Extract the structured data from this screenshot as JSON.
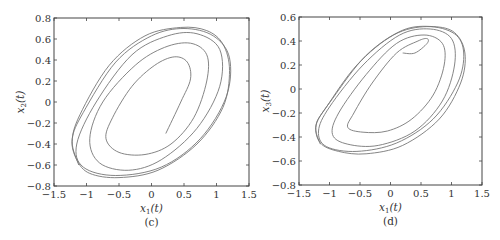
{
  "chart_data": [
    {
      "type": "line",
      "panel": "(c)",
      "title": "",
      "xlabel": "x1(t)",
      "ylabel": "x2(t)",
      "xlim": [
        -1.5,
        1.5
      ],
      "ylim": [
        -0.8,
        0.8
      ],
      "xticks": [
        "-1.5",
        "-1",
        "-0.5",
        "0",
        "0.5",
        "1",
        "1.5"
      ],
      "yticks": [
        "-0.8",
        "-0.6",
        "-0.4",
        "-0.2",
        "0",
        "0.2",
        "0.4",
        "0.6",
        "0.8"
      ],
      "grid": false,
      "legend": null,
      "description": "Phase-plane trajectory spiraling outward from about (0.2, -0.3) toward a tilted elliptical limit cycle",
      "series": [
        {
          "name": "trajectory",
          "points": [
            [
              0.22,
              -0.3
            ],
            [
              0.45,
              0.0
            ],
            [
              0.6,
              0.22
            ],
            [
              0.55,
              0.38
            ],
            [
              0.35,
              0.43
            ],
            [
              0.05,
              0.35
            ],
            [
              -0.3,
              0.15
            ],
            [
              -0.6,
              -0.15
            ],
            [
              -0.7,
              -0.35
            ],
            [
              -0.5,
              -0.48
            ],
            [
              -0.1,
              -0.5
            ],
            [
              0.3,
              -0.4
            ],
            [
              0.65,
              -0.15
            ],
            [
              0.85,
              0.2
            ],
            [
              0.85,
              0.45
            ],
            [
              0.6,
              0.56
            ],
            [
              0.2,
              0.52
            ],
            [
              -0.25,
              0.35
            ],
            [
              -0.75,
              0.0
            ],
            [
              -0.95,
              -0.35
            ],
            [
              -0.8,
              -0.58
            ],
            [
              -0.35,
              -0.65
            ],
            [
              0.15,
              -0.55
            ],
            [
              0.7,
              -0.25
            ],
            [
              1.05,
              0.15
            ],
            [
              1.05,
              0.5
            ],
            [
              0.7,
              0.65
            ],
            [
              0.25,
              0.63
            ],
            [
              -0.3,
              0.45
            ],
            [
              -0.85,
              0.0
            ],
            [
              -1.15,
              -0.4
            ],
            [
              -1.05,
              -0.62
            ],
            [
              -0.55,
              -0.7
            ],
            [
              0.15,
              -0.62
            ],
            [
              0.75,
              -0.35
            ],
            [
              1.15,
              0.05
            ],
            [
              1.2,
              0.42
            ],
            [
              0.95,
              0.63
            ],
            [
              0.5,
              0.7
            ],
            [
              0.0,
              0.63
            ],
            [
              -0.55,
              0.38
            ],
            [
              -1.05,
              -0.1
            ],
            [
              -1.22,
              -0.35
            ],
            [
              -1.15,
              -0.55
            ],
            [
              -0.95,
              -0.68
            ],
            [
              -0.5,
              -0.72
            ],
            [
              0.1,
              -0.65
            ],
            [
              0.7,
              -0.4
            ],
            [
              1.1,
              -0.05
            ],
            [
              1.2,
              0.3
            ],
            [
              1.1,
              0.55
            ],
            [
              0.85,
              0.68
            ],
            [
              0.45,
              0.71
            ],
            [
              -0.1,
              0.63
            ],
            [
              -0.65,
              0.35
            ],
            [
              -1.1,
              -0.12
            ],
            [
              -1.22,
              -0.38
            ],
            [
              -1.12,
              -0.6
            ]
          ]
        }
      ],
      "caption": "(c)"
    },
    {
      "type": "line",
      "panel": "(d)",
      "title": "",
      "xlabel": "x1(t)",
      "ylabel": "x3(t)",
      "xlim": [
        -1.5,
        1.5
      ],
      "ylim": [
        -0.8,
        0.6
      ],
      "xticks": [
        "-1.5",
        "-1",
        "-0.5",
        "0",
        "0.5",
        "1",
        "1.5"
      ],
      "yticks": [
        "-0.8",
        "-0.6",
        "-0.4",
        "-0.2",
        "0",
        "0.2",
        "0.4",
        "0.6"
      ],
      "grid": false,
      "legend": null,
      "description": "Phase-plane trajectory starting near (0.2, 0.3) spiraling outward toward a tilted elliptical limit cycle",
      "series": [
        {
          "name": "trajectory",
          "points": [
            [
              0.2,
              0.3
            ],
            [
              0.4,
              0.3
            ],
            [
              0.6,
              0.38
            ],
            [
              0.6,
              0.42
            ],
            [
              0.45,
              0.4
            ],
            [
              0.1,
              0.3
            ],
            [
              -0.3,
              0.05
            ],
            [
              -0.6,
              -0.2
            ],
            [
              -0.7,
              -0.32
            ],
            [
              -0.45,
              -0.36
            ],
            [
              -0.05,
              -0.35
            ],
            [
              0.35,
              -0.25
            ],
            [
              0.7,
              -0.05
            ],
            [
              0.88,
              0.2
            ],
            [
              0.85,
              0.38
            ],
            [
              0.55,
              0.45
            ],
            [
              0.1,
              0.38
            ],
            [
              -0.4,
              0.12
            ],
            [
              -0.85,
              -0.2
            ],
            [
              -0.95,
              -0.38
            ],
            [
              -0.7,
              -0.46
            ],
            [
              -0.2,
              -0.47
            ],
            [
              0.4,
              -0.35
            ],
            [
              0.85,
              -0.1
            ],
            [
              1.05,
              0.2
            ],
            [
              1.0,
              0.42
            ],
            [
              0.65,
              0.5
            ],
            [
              0.15,
              0.45
            ],
            [
              -0.45,
              0.2
            ],
            [
              -1.0,
              -0.15
            ],
            [
              -1.18,
              -0.35
            ],
            [
              -1.05,
              -0.48
            ],
            [
              -0.55,
              -0.52
            ],
            [
              0.1,
              -0.45
            ],
            [
              0.7,
              -0.25
            ],
            [
              1.1,
              0.05
            ],
            [
              1.2,
              0.3
            ],
            [
              1.05,
              0.46
            ],
            [
              0.6,
              0.52
            ],
            [
              0.05,
              0.45
            ],
            [
              -0.55,
              0.2
            ],
            [
              -1.05,
              -0.15
            ],
            [
              -1.22,
              -0.3
            ],
            [
              -1.15,
              -0.45
            ],
            [
              -0.85,
              -0.52
            ],
            [
              -0.4,
              -0.54
            ],
            [
              0.2,
              -0.47
            ],
            [
              0.8,
              -0.25
            ],
            [
              1.15,
              0.05
            ],
            [
              1.22,
              0.3
            ],
            [
              1.05,
              0.47
            ],
            [
              0.7,
              0.52
            ],
            [
              0.2,
              0.49
            ],
            [
              -0.4,
              0.28
            ],
            [
              -0.95,
              -0.08
            ],
            [
              -1.22,
              -0.3
            ],
            [
              -1.15,
              -0.46
            ]
          ]
        }
      ],
      "caption": "(d)"
    }
  ]
}
